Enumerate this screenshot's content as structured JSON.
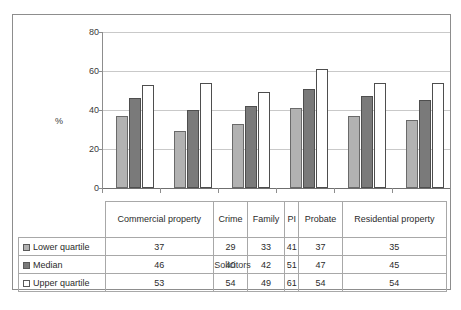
{
  "chart_data": {
    "type": "bar",
    "title": "",
    "subtitle": "",
    "xlabel": "Solicitors",
    "ylabel": "%",
    "ylim": [
      0,
      80
    ],
    "yticks": [
      0,
      20,
      40,
      60,
      80
    ],
    "grid": true,
    "legend_position": "table-left",
    "categories": [
      "Commercial property",
      "Crime",
      "Family",
      "PI",
      "Probate",
      "Residential property"
    ],
    "series": [
      {
        "name": "Lower quartile",
        "values": [
          37,
          29,
          33,
          41,
          37,
          35
        ],
        "color": "#b2b2b2"
      },
      {
        "name": "Median",
        "values": [
          46,
          40,
          42,
          51,
          47,
          45
        ],
        "color": "#7a7a7a"
      },
      {
        "name": "Upper quartile",
        "values": [
          53,
          54,
          49,
          61,
          54,
          54
        ],
        "color": "#ffffff"
      }
    ]
  },
  "axis": {
    "y_title": "%",
    "y_tick_0": "0",
    "y_tick_20": "20",
    "y_tick_40": "40",
    "y_tick_60": "60",
    "y_tick_80": "80",
    "x_title": "Solicitors"
  },
  "table": {
    "category_headers": [
      "Commercial property",
      "Crime",
      "Family",
      "PI",
      "Probate",
      "Residential property"
    ],
    "rows": [
      {
        "label": "Lower quartile",
        "swatch": "light-gray-swatch-icon",
        "values": [
          "37",
          "29",
          "33",
          "41",
          "37",
          "35"
        ]
      },
      {
        "label": "Median",
        "swatch": "dark-gray-swatch-icon",
        "values": [
          "46",
          "40",
          "42",
          "51",
          "47",
          "45"
        ]
      },
      {
        "label": "Upper quartile",
        "swatch": "white-swatch-icon",
        "values": [
          "53",
          "54",
          "49",
          "61",
          "54",
          "54"
        ]
      }
    ]
  },
  "colors": {
    "lower_quartile": "#b2b2b2",
    "median": "#7a7a7a",
    "upper_quartile": "#ffffff",
    "gridline": "#c9c9c9",
    "frame": "#8d8d8d"
  }
}
